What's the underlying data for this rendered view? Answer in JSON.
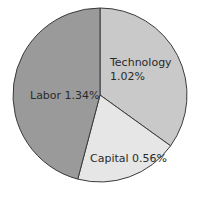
{
  "chart_data": {
    "type": "pie",
    "title": "",
    "categories": [
      "Technology",
      "Capital",
      "Labor"
    ],
    "values": [
      1.02,
      0.56,
      1.34
    ],
    "unit": "%",
    "start_angle": "12 o'clock",
    "direction": "clockwise",
    "labels": [
      "Technology 1.02%",
      "Capital 0.56%",
      "Labor 1.34%"
    ],
    "colors": [
      "#c9c9c9",
      "#e6e6e6",
      "#9a9a9a"
    ],
    "legend": "none (inline slice labels)"
  },
  "labels": {
    "technology_name": "Technology",
    "technology_value": "1.02%",
    "capital": "Capital 0.56%",
    "labor": "Labor 1.34%"
  }
}
